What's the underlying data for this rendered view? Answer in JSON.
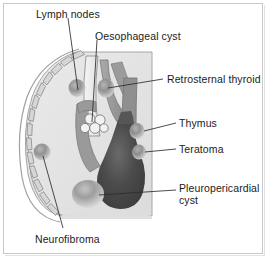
{
  "figure": {
    "view": "Lateral chest cross-section",
    "background_color": "#ffffff",
    "frame_color": "#c9c9c9",
    "text_color": "#1b1b1b"
  },
  "anatomy": {
    "ribcage": {
      "name": "ribcage-arc",
      "segment_count": 10,
      "fill": "#d8d8d8",
      "stroke": "#8e8e8e"
    },
    "lung_field": {
      "name": "lung-field",
      "fill": "#e4e4e4",
      "stroke": "#9a9a9a"
    },
    "trachea": {
      "name": "trachea",
      "fill": "#f0f0f0",
      "stroke": "#8a8a8a"
    },
    "aortic_arch": {
      "name": "aortic-arch",
      "fill": "#9d9d9d",
      "stroke": "#6e6e6e"
    },
    "heart": {
      "name": "heart-silhouette",
      "fill": "#4a4a4a",
      "stroke": "#3a3a3a"
    },
    "diaphragm": {
      "name": "diaphragm",
      "fill": "#e0e0e0"
    }
  },
  "lesions": [
    {
      "id": "lymph-nodes",
      "label": "Lymph nodes",
      "marker": "nodule",
      "color": "#8d8d8d",
      "marker_x": 77,
      "marker_y": 88,
      "label_x": 36,
      "label_y": 10
    },
    {
      "id": "oesophageal-cyst",
      "label": "Oesophageal cyst",
      "marker": "cyst-cluster",
      "color": "#f4f4f4",
      "marker_x": 95,
      "marker_y": 124,
      "label_x": 95,
      "label_y": 30
    },
    {
      "id": "retrosternal-thyroid",
      "label": "Retrosternal thyroid",
      "marker": "nodule",
      "color": "#8a8a8a",
      "marker_x": 106,
      "marker_y": 88,
      "label_x": 167,
      "label_y": 74
    },
    {
      "id": "thymus",
      "label": "Thymus",
      "marker": "nodule",
      "color": "#8a8a8a",
      "marker_x": 137,
      "marker_y": 131,
      "label_x": 179,
      "label_y": 117
    },
    {
      "id": "teratoma",
      "label": "Teratoma",
      "marker": "nodule",
      "color": "#8a8a8a",
      "marker_x": 139,
      "marker_y": 151,
      "label_x": 179,
      "label_y": 143
    },
    {
      "id": "pleuropericardial-cyst",
      "label": "Pleuropericardial cyst",
      "marker": "nodule-large",
      "color": "#9e9e9e",
      "marker_x": 88,
      "marker_y": 194,
      "label_x": 179,
      "label_y": 182
    },
    {
      "id": "neurofibroma",
      "label": "Neurofibroma",
      "marker": "nodule",
      "color": "#8a8a8a",
      "marker_x": 42,
      "marker_y": 152,
      "label_x": 35,
      "label_y": 234
    }
  ]
}
